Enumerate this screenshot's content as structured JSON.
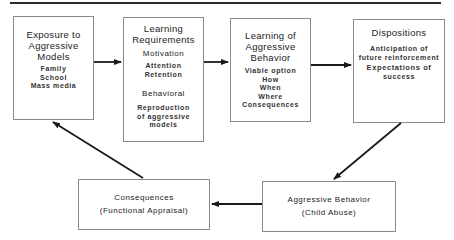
{
  "diagram": {
    "boxes": {
      "exposure": {
        "title_lines": [
          "Exposure to",
          "Aggressive",
          "Models"
        ],
        "items": [
          "Family",
          "School",
          "Mass media"
        ]
      },
      "learning_requirements": {
        "title_lines": [
          "Learning",
          "Requirements"
        ],
        "section1": "Motivation",
        "section1_items": [
          "Attention",
          "Retention"
        ],
        "section2": "Behavioral",
        "section2_items": [
          "Reproduction",
          "of aggressive",
          "models"
        ]
      },
      "learning_behavior": {
        "title_lines": [
          "Learning of",
          "Aggressive",
          "Behavior"
        ],
        "items": [
          "Viable option",
          "How",
          "When",
          "Where",
          "Consequences"
        ]
      },
      "dispositions": {
        "title": "Dispositions",
        "items": [
          "Anticipation of",
          "future reinforcement",
          "Expectations of",
          "success"
        ]
      },
      "consequences": {
        "line1": "Consequences",
        "line2": "(Functional Appraisal)"
      },
      "aggressive_behavior": {
        "line1": "Aggressive Behavior",
        "line2": "(Child Abuse)"
      }
    },
    "arrows": [
      {
        "from": "exposure",
        "to": "learning_requirements"
      },
      {
        "from": "learning_requirements",
        "to": "learning_behavior"
      },
      {
        "from": "learning_behavior",
        "to": "dispositions"
      },
      {
        "from": "dispositions",
        "to": "aggressive_behavior"
      },
      {
        "from": "aggressive_behavior",
        "to": "consequences"
      },
      {
        "from": "consequences",
        "to": "exposure"
      }
    ],
    "colors": {
      "line": "#1a1a1a",
      "border": "#8a8a8a",
      "background": "#ffffff"
    }
  }
}
